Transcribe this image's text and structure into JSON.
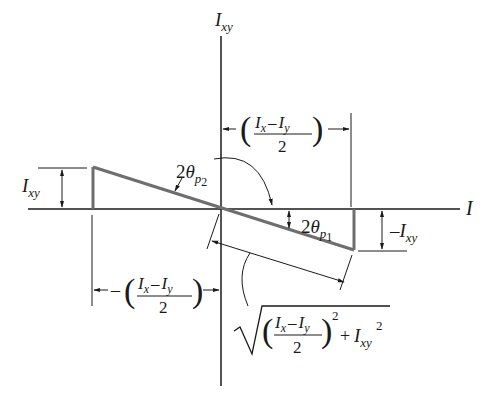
{
  "diagram": {
    "axes": {
      "vertical_label": {
        "main": "I",
        "sub": "xy"
      },
      "horizontal_label": {
        "main": "I"
      }
    },
    "angles": {
      "theta_p2": {
        "coef": "2",
        "sym": "θ",
        "sub": "p",
        "subsub": "2"
      },
      "theta_p1": {
        "coef": "2",
        "sym": "θ",
        "sub": "p",
        "subsub": "1"
      }
    },
    "dimensions": {
      "left_height": {
        "main": "I",
        "sub": "xy"
      },
      "right_height": {
        "prefix": "–",
        "main": "I",
        "sub": "xy"
      },
      "top_half_diff": {
        "num_a": "I",
        "num_a_sub": "x",
        "minus": "–",
        "num_b": "I",
        "num_b_sub": "y",
        "den": "2"
      },
      "bottom_half_diff": {
        "prefix": "–",
        "num_a": "I",
        "num_a_sub": "x",
        "minus": "–",
        "num_b": "I",
        "num_b_sub": "y",
        "den": "2"
      },
      "hypotenuse": {
        "num_a": "I",
        "num_a_sub": "x",
        "minus": "–",
        "num_b": "I",
        "num_b_sub": "y",
        "den": "2",
        "sq": "2",
        "plus": "+",
        "last": "I",
        "last_sub": "xy",
        "last_sq": "2"
      }
    },
    "colors": {
      "line": "#1a1a1a",
      "triangle": "#6e6e6e",
      "background": "#ffffff"
    }
  }
}
